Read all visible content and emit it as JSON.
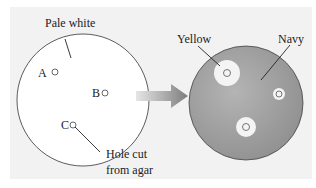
{
  "left_plate": {
    "label": "Pale white",
    "holes": [
      {
        "id": "A",
        "label": "A"
      },
      {
        "id": "B",
        "label": "B"
      },
      {
        "id": "C",
        "label": "C"
      }
    ],
    "hole_annotation_line1": "Hole cut",
    "hole_annotation_line2": "from agar",
    "fill": "#ffffff"
  },
  "arrow": {
    "direction": "right",
    "color": "#8a8a8a"
  },
  "right_plate": {
    "label_left": "Yellow",
    "label_right": "Navy",
    "fill": "#9a9a9a"
  }
}
